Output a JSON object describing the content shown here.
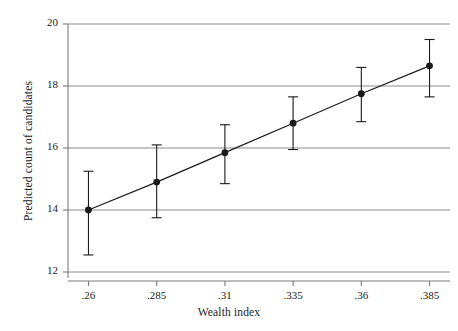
{
  "chart_data": {
    "type": "line",
    "title": "",
    "subtitle": "",
    "xlabel": "Wealth index",
    "ylabel": "Predicted count of candidates",
    "x": [
      0.26,
      0.285,
      0.31,
      0.335,
      0.36,
      0.385
    ],
    "xtick_labels": [
      ".26",
      ".285",
      ".31",
      ".335",
      ".36",
      ".385"
    ],
    "ytick_labels": [
      "12",
      "14",
      "16",
      "18",
      "20"
    ],
    "ytick_values": [
      12,
      14,
      16,
      18,
      20
    ],
    "ylim": [
      11.8,
      20.2
    ],
    "xlim": [
      0.2525,
      0.3925
    ],
    "grid": "horizontal",
    "legend": "none",
    "series": [
      {
        "name": "Predicted count of candidates",
        "marker": "filled-circle",
        "color": "#1a1a1a",
        "values": [
          14.0,
          14.9,
          15.85,
          16.8,
          17.75,
          18.65
        ],
        "errors_low": [
          12.55,
          13.75,
          14.85,
          15.95,
          16.85,
          17.65
        ],
        "errors_high": [
          15.25,
          16.1,
          16.75,
          17.65,
          18.6,
          19.5
        ]
      }
    ],
    "annotations": []
  },
  "layout": {
    "plot_left": 68,
    "plot_right": 450,
    "plot_top": 24,
    "plot_bottom": 272,
    "axis_color": "#7b7b7b",
    "grid_color": "#8c8c8c",
    "line_color": "#1a1a1a",
    "background": "#ffffff"
  }
}
